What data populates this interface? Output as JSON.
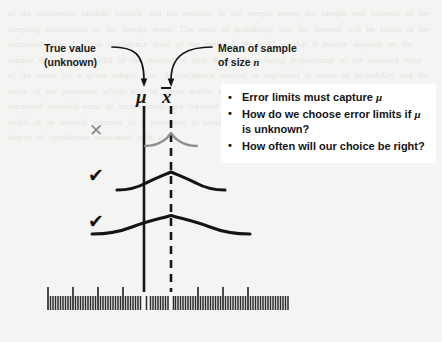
{
  "figure": {
    "type": "statistics-diagram",
    "background_color": "#f4f4f2",
    "ink_color": "#161616",
    "muted_ink_color": "#8b8b8b"
  },
  "callouts": [
    {
      "name": "true-value",
      "line1": "True value",
      "line2": "(unknown)",
      "points_to": "mu-axis-line"
    },
    {
      "name": "mean-of-sample",
      "line1": "Mean of sample",
      "line2_prefix": "of size ",
      "line2_italic": "n",
      "points_to": "xbar-axis-line"
    }
  ],
  "axes": [
    {
      "name": "mu-axis",
      "symbol": "μ",
      "style": "solid",
      "x_px": 144,
      "description": "true population mean, unknown"
    },
    {
      "name": "xbar-axis",
      "symbol": "x",
      "overbar": true,
      "style": "dashed",
      "x_px": 171,
      "description": "sample mean of size n"
    }
  ],
  "intervals": [
    {
      "name": "interval-1",
      "verdict_mark": "✕",
      "verdict": "miss",
      "captures_mu": false,
      "color": "#8b8b8b",
      "half_width_px": 26,
      "center_x_px": 171,
      "y_px": 139
    },
    {
      "name": "interval-2",
      "verdict_mark": "✔",
      "verdict": "capture",
      "captures_mu": true,
      "color": "#141414",
      "half_width_px": 54,
      "center_x_px": 171,
      "y_px": 180
    },
    {
      "name": "interval-3",
      "verdict_mark": "✔",
      "verdict": "capture",
      "captures_mu": true,
      "color": "#141414",
      "half_width_px": 79,
      "center_x_px": 171,
      "y_px": 224
    }
  ],
  "ruler": {
    "name": "measurement-scale",
    "left_px": 48,
    "right_px": 288,
    "baseline_y_px": 310,
    "minor_tick_count": 97,
    "minor_tick_height_px": 15,
    "major_tick_every": 10,
    "major_tick_height_px": 24
  },
  "bullets": {
    "panel_background": "#ffffff",
    "items": [
      {
        "name": "bullet-capture",
        "parts": [
          {
            "t": "Error limits must capture ",
            "style": "normal"
          },
          {
            "t": "μ",
            "style": "italic"
          }
        ]
      },
      {
        "name": "bullet-choose-limits",
        "parts": [
          {
            "t": "How do we choose error limits if ",
            "style": "normal"
          },
          {
            "t": "μ",
            "style": "italic"
          },
          {
            "t": " is unknown?",
            "style": "normal"
          }
        ]
      },
      {
        "name": "bullet-how-often",
        "parts": [
          {
            "t": "How often will our choice be right?",
            "style": "normal"
          }
        ]
      }
    ]
  },
  "ghost_text": "of the continuous random variable and the estimate of the sample mean, the sample and variance of the sampling distribution of the sample mean. The error of probability that the interval will be found in the estimated interval is the confidence level of the mean at the level so that it mainly depends on the sample size and the width of the interval is then discussed as being proportional to the standard error of the mean for a given sample size. A confidence interval is expressed in terms of probability and the value of the parameter which will be found within a certain confidence limit and the values of the estimated standard error of measurement are reported in Table 1 based on a sample of observations. The width of an interval estimate of a parameter is usually reported together with the point estimate and the degree of confidence associated with it."
}
